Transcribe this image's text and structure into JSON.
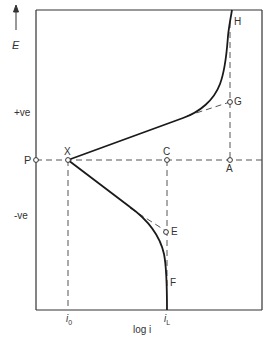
{
  "diagram": {
    "type": "polarization-curve",
    "axis": {
      "y_label": "E",
      "x_label": "log i",
      "y_positive": "+ve",
      "y_negative": "-ve",
      "x_ticks": [
        {
          "label": "i",
          "sub": "0",
          "name": "i0"
        },
        {
          "label": "i",
          "sub": "L",
          "name": "iL"
        }
      ]
    },
    "points": [
      {
        "id": "P",
        "label": "P"
      },
      {
        "id": "X",
        "label": "X"
      },
      {
        "id": "C",
        "label": "C"
      },
      {
        "id": "A",
        "label": "A"
      },
      {
        "id": "G",
        "label": "G"
      },
      {
        "id": "H",
        "label": "H"
      },
      {
        "id": "E",
        "label": "E"
      },
      {
        "id": "F",
        "label": "F"
      }
    ],
    "colors": {
      "curve": "#1a1a1a",
      "dashed": "#555555",
      "frame": "#333333",
      "text": "#333333",
      "background": "#ffffff"
    }
  }
}
